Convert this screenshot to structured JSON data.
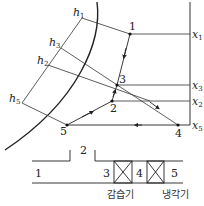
{
  "diagram": {
    "title": "",
    "enthalpy_lines": [
      {
        "label": "h",
        "sub": "1"
      },
      {
        "label": "h",
        "sub": "3"
      },
      {
        "label": "h",
        "sub": "2"
      },
      {
        "label": "h",
        "sub": "5"
      }
    ],
    "humidity_lines": [
      {
        "label": "x",
        "sub": "1"
      },
      {
        "label": "x",
        "sub": "3"
      },
      {
        "label": "x",
        "sub": "2"
      },
      {
        "label": "x",
        "sub": "5"
      }
    ],
    "state_points": [
      "1",
      "2",
      "3",
      "4",
      "5"
    ],
    "duct": {
      "inlet_label": "1",
      "mix_label": "2",
      "sections": [
        "3",
        "4",
        "5"
      ],
      "humidifier_label": "감습기",
      "cooler_label": "냉각기"
    }
  }
}
